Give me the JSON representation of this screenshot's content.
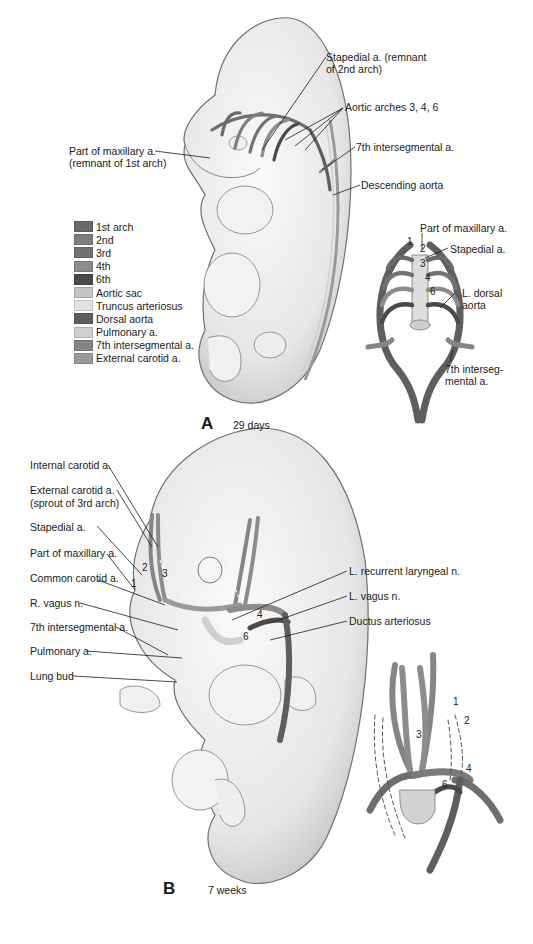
{
  "panel_a": {
    "letter": "A",
    "caption": "29 days",
    "labels": {
      "stapedial_line1": "Stapedial a. (remnant",
      "stapedial_line2": "of 2nd arch)",
      "aortic_arches": "Aortic arches 3, 4, 6",
      "maxillary_line1": "Part of maxillary a.",
      "maxillary_line2": "(remnant of 1st arch)",
      "seventh_intersegmental": "7th intersegmental a.",
      "descending_aorta": "Descending aorta"
    },
    "inset_labels": {
      "part_of_maxillary": "Part of maxillary a.",
      "stapedial": "Stapedial a.",
      "l_dorsal_line1": "L. dorsal",
      "l_dorsal_line2": "aorta",
      "seventh_line1": "7th interseg-",
      "seventh_line2": "mental a.",
      "arch_numbers": [
        "1",
        "2",
        "3",
        "4",
        "6"
      ]
    }
  },
  "legend": {
    "items": [
      {
        "label": "1st arch",
        "color": "#6a6a6a"
      },
      {
        "label": "2nd",
        "color": "#7e7e7e"
      },
      {
        "label": "3rd",
        "color": "#727272"
      },
      {
        "label": "4th",
        "color": "#8c8c8c"
      },
      {
        "label": "6th",
        "color": "#4a4a4a"
      },
      {
        "label": "Aortic sac",
        "color": "#c4c4c4"
      },
      {
        "label": "Truncus arteriosus",
        "color": "#e2e2e2"
      },
      {
        "label": "Dorsal aorta",
        "color": "#5e5e5e"
      },
      {
        "label": "Pulmonary a.",
        "color": "#cfcfcf"
      },
      {
        "label": "7th intersegmental a.",
        "color": "#858585"
      },
      {
        "label": "External carotid a.",
        "color": "#9a9a9a"
      }
    ]
  },
  "panel_b": {
    "letter": "B",
    "caption": "7 weeks",
    "left_labels": {
      "internal_carotid": "Internal carotid a.",
      "external_carotid_line1": "External carotid a.",
      "external_carotid_line2": "(sprout of 3rd arch)",
      "stapedial": "Stapedial a.",
      "part_of_maxillary": "Part of maxillary a.",
      "common_carotid": "Common carotid a.",
      "r_vagus": "R. vagus n.",
      "seventh_intersegmental": "7th intersegmental a.",
      "pulmonary": "Pulmonary a.",
      "lung_bud": "Lung bud"
    },
    "right_labels": {
      "l_recurrent_laryngeal": "L. recurrent laryngeal n.",
      "l_vagus": "L. vagus n.",
      "ductus_arteriosus": "Ductus arteriosus"
    },
    "embryo_numbers": [
      "1",
      "2",
      "3",
      "4",
      "6"
    ],
    "inset_numbers": [
      "1",
      "2",
      "3",
      "4",
      "6"
    ]
  }
}
